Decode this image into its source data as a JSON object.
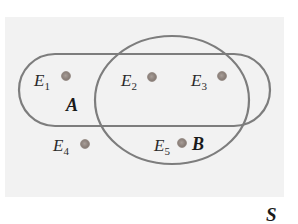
{
  "diagram": {
    "type": "venn",
    "universe_label": "S",
    "colors": {
      "universe_fill": "#f2f2f2",
      "outline": "#7d7d7d",
      "dot": "#8c817b",
      "text": "#2a2a2a"
    },
    "sets": [
      {
        "name": "A",
        "label": "A",
        "shape": "rounded-rectangle"
      },
      {
        "name": "B",
        "label": "B",
        "shape": "ellipse"
      }
    ],
    "elements": [
      {
        "name": "E1",
        "base": "E",
        "sub": "1",
        "in": [
          "A"
        ]
      },
      {
        "name": "E2",
        "base": "E",
        "sub": "2",
        "in": [
          "A",
          "B"
        ]
      },
      {
        "name": "E3",
        "base": "E",
        "sub": "3",
        "in": [
          "A",
          "B"
        ]
      },
      {
        "name": "E4",
        "base": "E",
        "sub": "4",
        "in": []
      },
      {
        "name": "E5",
        "base": "E",
        "sub": "5",
        "in": [
          "B"
        ]
      }
    ]
  }
}
